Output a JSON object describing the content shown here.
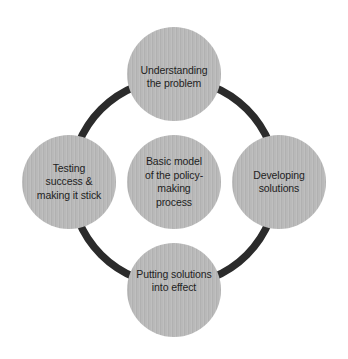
{
  "diagram": {
    "type": "cycle-diagram",
    "background_color": "#ffffff",
    "ring": {
      "name": "cycle-ring",
      "color": "#2b2b2b",
      "stroke_width_px": 7,
      "center_x": 174,
      "center_y": 182,
      "radius_px": 103
    },
    "node_style": {
      "fill_color": "#b9b9b9",
      "text_color": "#1e1e1e",
      "diameter_px": 94
    },
    "center_node": {
      "id": "center",
      "label": "Basic model\nof the policy-\nmaking\nprocess",
      "position": "center"
    },
    "stages": [
      {
        "id": "understanding",
        "order": 1,
        "label": "Understanding\nthe problem",
        "position": "top"
      },
      {
        "id": "developing",
        "order": 2,
        "label": "Developing\nsolutions",
        "position": "right"
      },
      {
        "id": "putting",
        "order": 3,
        "label": "Putting solutions\ninto effect",
        "position": "bottom"
      },
      {
        "id": "testing",
        "order": 4,
        "label": "Testing\nsuccess &\nmaking it stick",
        "position": "left"
      }
    ]
  }
}
